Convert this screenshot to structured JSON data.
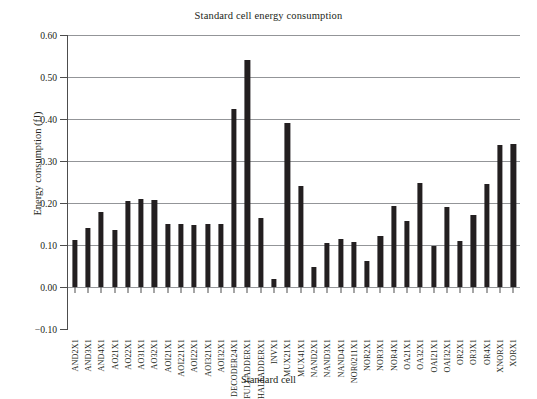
{
  "chart_data": {
    "type": "bar",
    "title": "Standard cell energy consumption",
    "xlabel": "Standard cell",
    "ylabel": "Energy consumption (fJ)",
    "ylim": [
      -0.1,
      0.6
    ],
    "yticks": [
      "0.60",
      "0.50",
      "0.40",
      "0.30",
      "0.20",
      "0.10",
      "0.00",
      "−0.10"
    ],
    "ytick_values": [
      0.6,
      0.5,
      0.4,
      0.3,
      0.2,
      0.1,
      0.0,
      -0.1
    ],
    "grid": true,
    "legend": "none",
    "bar_color": "#231f20",
    "categories": [
      "AND2X1",
      "AND3X1",
      "AND4X1",
      "AO21X1",
      "AO22X1",
      "AO31X1",
      "AO32X1",
      "AOI21X1",
      "AOI221X1",
      "AOI22X1",
      "AOI321X1",
      "AOI32X1",
      "DECODER24X1",
      "FULLADDERX1",
      "HALFADDERX1",
      "INVX1",
      "MUX21X1",
      "MUX41X1",
      "NAND2X1",
      "NAND3X1",
      "NAND4X1",
      "NOR0211X1",
      "NOR2X1",
      "NOR3X1",
      "NOR4X1",
      "OA21X1",
      "OA32X1",
      "OAI21X1",
      "OAI32X1",
      "OR2X1",
      "OR3X1",
      "OR4X1",
      "XNORX1",
      "XORX1"
    ],
    "values": [
      0.113,
      0.14,
      0.178,
      0.135,
      0.205,
      0.21,
      0.208,
      0.15,
      0.15,
      0.148,
      0.15,
      0.15,
      0.425,
      0.54,
      0.165,
      0.02,
      0.39,
      0.24,
      0.048,
      0.105,
      0.115,
      0.108,
      0.063,
      0.122,
      0.192,
      0.158,
      0.248,
      0.097,
      0.19,
      0.11,
      0.172,
      0.245,
      0.338,
      0.34
    ]
  }
}
